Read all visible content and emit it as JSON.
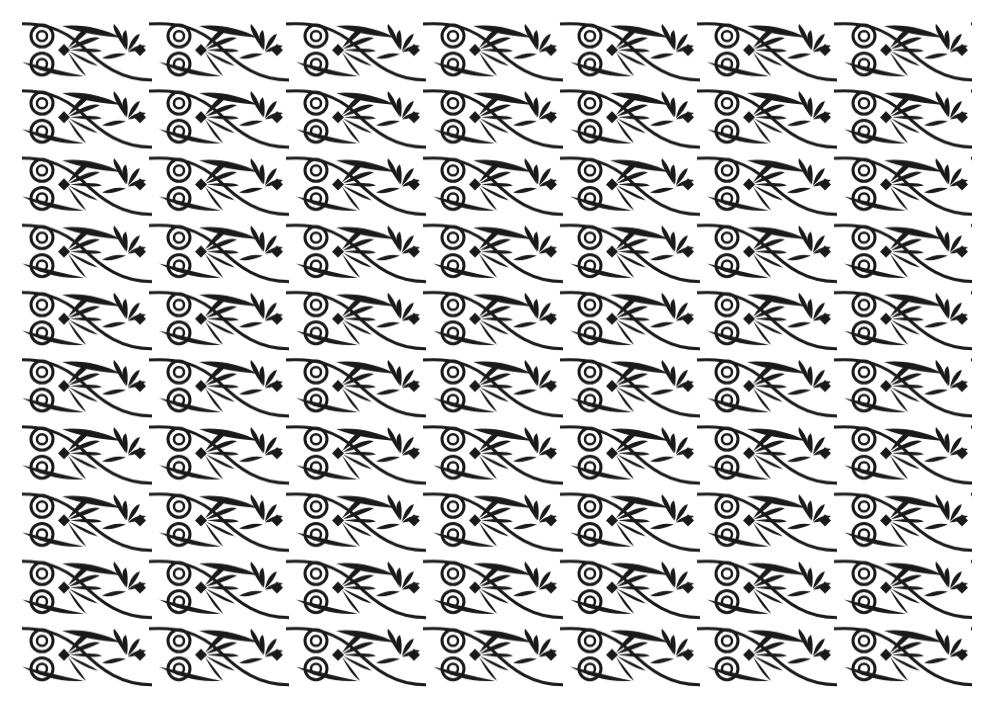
{
  "image": {
    "description": "Greek-style ornamental border pattern with palmettes, double spirals and leaf shapes, repeated in diagonal bands",
    "background_color": "#ffffff",
    "ink_color": "#1a1a1a",
    "pattern_area": {
      "x": 22,
      "y": 18,
      "width": 950,
      "height": 672
    },
    "rows": 10,
    "row_height": 67.2,
    "tile_width": 137,
    "motifs": [
      "palmette",
      "double-spiral",
      "lanceolate-leaf",
      "s-curve-tendril",
      "diamond-center"
    ]
  }
}
